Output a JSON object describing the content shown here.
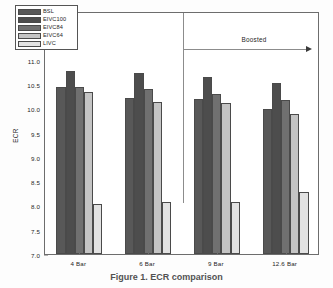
{
  "figure": {
    "caption": "Figure 1. ECR comparison"
  },
  "chart_data": {
    "type": "bar",
    "title": "",
    "xlabel": "",
    "ylabel": "ECR",
    "ylim": [
      7.0,
      12.0
    ],
    "ytick_step": 0.5,
    "yticks": [
      "12.0",
      "11.5",
      "11.0",
      "10.5",
      "10.0",
      "9.5",
      "9.0",
      "8.5",
      "8.0",
      "7.5",
      "7.0"
    ],
    "grid": false,
    "legend_position": "upper-left",
    "categories": [
      "4 Bar",
      "6 Bar",
      "9 Bar",
      "12.6 Bar"
    ],
    "series": [
      {
        "name": "BSL",
        "color": "#585858",
        "values": [
          10.44,
          10.21,
          10.18,
          9.98
        ]
      },
      {
        "name": "EIVC100",
        "color": "#4d4d4d",
        "values": [
          10.77,
          10.72,
          10.65,
          10.51
        ]
      },
      {
        "name": "EIVC84",
        "color": "#707070",
        "values": [
          10.43,
          10.4,
          10.3,
          10.16
        ]
      },
      {
        "name": "EIVC64",
        "color": "#c4c4c4",
        "values": [
          10.33,
          10.13,
          10.1,
          9.89
        ]
      },
      {
        "name": "LIVC",
        "color": "#e2e2e2",
        "values": [
          8.02,
          8.07,
          8.08,
          8.28
        ]
      }
    ],
    "annotations": [
      {
        "name": "boosted",
        "text": "Boosted",
        "arrow": "right",
        "divider_after_category": "6 Bar"
      }
    ]
  }
}
